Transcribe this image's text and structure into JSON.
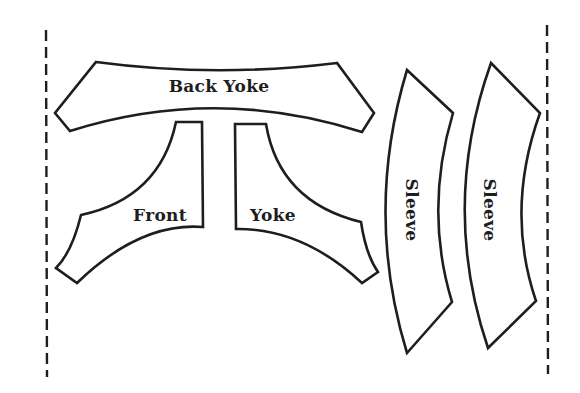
{
  "diagram": {
    "type": "sewing-pattern-layout",
    "colors": {
      "stroke": "#1e1e1e",
      "background": "#ffffff",
      "piece_fill": "#ffffff"
    },
    "fold_lines": [
      {
        "name": "left-fold-line",
        "style": "dashed"
      },
      {
        "name": "right-fold-line",
        "style": "dashed"
      }
    ],
    "pieces": [
      {
        "name": "back-yoke",
        "label": "Back Yoke",
        "orientation": "horizontal"
      },
      {
        "name": "front",
        "label": "Front",
        "orientation": "horizontal"
      },
      {
        "name": "yoke",
        "label": "Yoke",
        "orientation": "horizontal"
      },
      {
        "name": "sleeve-1",
        "label": "Sleeve",
        "orientation": "vertical"
      },
      {
        "name": "sleeve-2",
        "label": "Sleeve",
        "orientation": "vertical"
      }
    ]
  }
}
